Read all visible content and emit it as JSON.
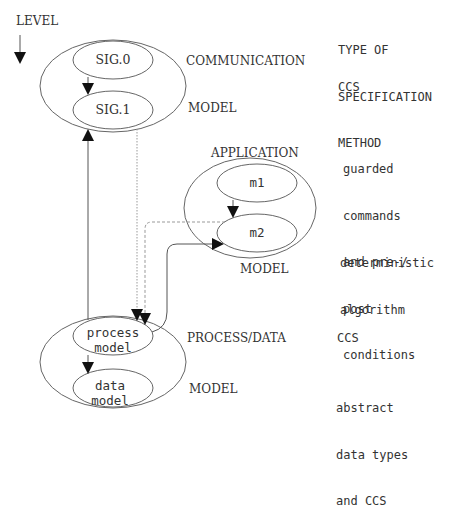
{
  "diagram": {
    "level_label": "LEVEL",
    "spec_header": [
      "TYPE OF",
      "SPECIFICATION",
      "METHOD"
    ],
    "levels": [
      {
        "name_line1": "COMMUNICATION",
        "name_line2": "MODEL",
        "spec_method": [
          "CCS"
        ],
        "nodes": [
          "SIG.0",
          "SIG.1"
        ]
      },
      {
        "name_line1": "APPLICATION",
        "name_line2": "MODEL",
        "spec_method_top": [
          "guarded",
          "commands",
          "and pre-/",
          "post",
          "conditions"
        ],
        "spec_method_bottom": [
          "deterministic",
          "algorithm"
        ],
        "nodes": [
          "m1",
          "m2"
        ]
      },
      {
        "name_line1": "PROCESS/DATA",
        "name_line2": "MODEL",
        "spec_method_top": [
          "CCS"
        ],
        "spec_method_bottom": [
          "abstract",
          "data types",
          "and CCS"
        ],
        "nodes": [
          {
            "line1": "process",
            "line2": "model"
          },
          {
            "line1": "data",
            "line2": "model"
          }
        ]
      }
    ],
    "colors": {
      "line": "#555555",
      "dotted": "#999999",
      "text": "#333333"
    }
  }
}
